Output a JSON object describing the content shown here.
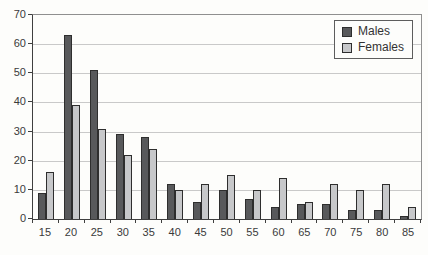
{
  "chart_data": {
    "type": "bar",
    "title": "",
    "xlabel": "",
    "ylabel": "",
    "categories": [
      "15",
      "20",
      "25",
      "30",
      "35",
      "40",
      "45",
      "50",
      "55",
      "60",
      "65",
      "70",
      "75",
      "80",
      "85"
    ],
    "series": [
      {
        "name": "Males",
        "color": "#58595b",
        "values": [
          9,
          63,
          51,
          29,
          28,
          12,
          6,
          10,
          7,
          4,
          5,
          5,
          3,
          3,
          1
        ]
      },
      {
        "name": "Females",
        "color": "#c7c8ca",
        "values": [
          16,
          39,
          31,
          22,
          24,
          10,
          12,
          15,
          10,
          14,
          6,
          12,
          10,
          12,
          4
        ]
      }
    ],
    "ylim": [
      0,
      70
    ],
    "yticks": [
      0,
      10,
      20,
      30,
      40,
      50,
      60,
      70
    ],
    "grid": "horizontal",
    "legend_position": "top-right",
    "colors": {
      "gridline": "#c9c9c9",
      "axis": "#3f3f3f",
      "plot_border": "#8f8f8f",
      "text": "#3a3a3a",
      "background": "#fdfdfb"
    }
  },
  "legend": {
    "items": [
      {
        "label": "Males"
      },
      {
        "label": "Females"
      }
    ]
  }
}
